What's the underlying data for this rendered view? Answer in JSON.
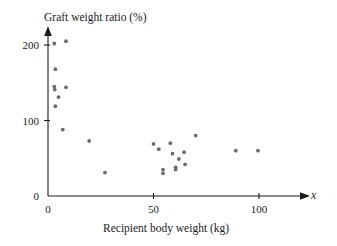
{
  "chart_data": {
    "type": "scatter",
    "title": "Graft weight ratio (%)",
    "xlabel": "Recipient body weight (kg)",
    "ylabel": "Graft weight ratio (%)",
    "x_axis_variable_symbol": "x",
    "xlim": [
      0,
      112
    ],
    "ylim": [
      0,
      212
    ],
    "xticks": [
      0,
      50,
      100
    ],
    "xtick_labels": [
      "0",
      "50",
      "100"
    ],
    "yticks": [
      0,
      100,
      200
    ],
    "ytick_labels": [
      "0",
      "100",
      "200"
    ],
    "grid": false,
    "legend": null,
    "point_color": "#6b6b6b",
    "axis_color": "#1a1a1a",
    "background_color": "#ffffff",
    "series": [
      {
        "name": "Liver graft observations",
        "points": [
          [
            3.0,
            202
          ],
          [
            8.5,
            205
          ],
          [
            3.5,
            168
          ],
          [
            3.0,
            145
          ],
          [
            3.2,
            141
          ],
          [
            8.5,
            144
          ],
          [
            5.0,
            131
          ],
          [
            3.5,
            119
          ],
          [
            7.0,
            88
          ],
          [
            19.5,
            73
          ],
          [
            27.0,
            31
          ],
          [
            50.0,
            69
          ],
          [
            52.5,
            62
          ],
          [
            54.5,
            35
          ],
          [
            54.5,
            30
          ],
          [
            58.0,
            70
          ],
          [
            59.0,
            56
          ],
          [
            60.5,
            38
          ],
          [
            60.5,
            35
          ],
          [
            62.0,
            49
          ],
          [
            64.5,
            58
          ],
          [
            65.0,
            42
          ],
          [
            70.0,
            80
          ],
          [
            89.0,
            60
          ],
          [
            99.5,
            60
          ]
        ]
      }
    ]
  }
}
